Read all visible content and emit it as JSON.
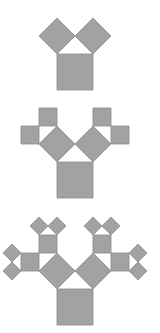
{
  "diagram": {
    "title": "",
    "fill_color": "#a2a2a2",
    "stroke_color": "#8c8c8c",
    "background": "#ffffff",
    "figures": [
      {
        "name": "stage-1",
        "base_x": 57,
        "base_y": 54,
        "side": 36,
        "depth": 1
      },
      {
        "name": "stage-2",
        "base_x": 57,
        "base_y": 162,
        "side": 36,
        "depth": 2
      },
      {
        "name": "stage-3",
        "base_x": 57,
        "base_y": 289,
        "side": 36,
        "depth": 3
      }
    ]
  }
}
